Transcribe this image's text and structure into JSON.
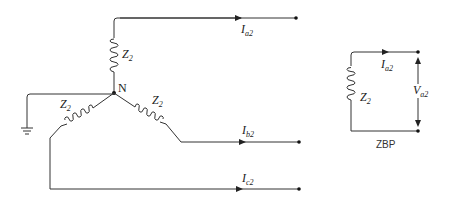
{
  "diagram": {
    "type": "negative-sequence network of wye-connected impedance load",
    "neutral_label": "N",
    "impedances": [
      {
        "id": "phase-a",
        "symbol": "Z",
        "subscript": "2"
      },
      {
        "id": "phase-b",
        "symbol": "Z",
        "subscript": "2"
      },
      {
        "id": "phase-c",
        "symbol": "Z",
        "subscript": "2"
      }
    ],
    "currents": [
      {
        "id": "a",
        "symbol": "I",
        "subscript": "a2"
      },
      {
        "id": "b",
        "symbol": "I",
        "subscript": "b2"
      },
      {
        "id": "c",
        "symbol": "I",
        "subscript": "c2"
      }
    ],
    "ground": "ground-symbol"
  },
  "equivalent": {
    "impedance": {
      "symbol": "Z",
      "subscript": "2"
    },
    "current": {
      "symbol": "I",
      "subscript": "a2"
    },
    "voltage": {
      "symbol": "V",
      "subscript": "a2"
    },
    "caption": "ZBP"
  },
  "colors": {
    "line": "#333333",
    "background": "#ffffff"
  }
}
